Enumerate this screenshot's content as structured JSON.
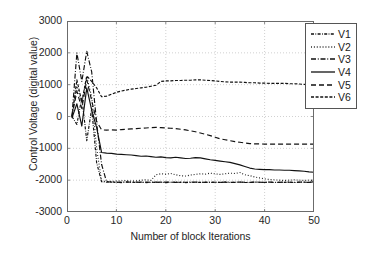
{
  "chart_data": {
    "type": "line",
    "title": "",
    "xlabel": "Number of block Iterations",
    "ylabel": "Control Voltage (digital value)",
    "xlim": [
      0,
      50
    ],
    "ylim": [
      -3000,
      3000
    ],
    "xticks": [
      0,
      10,
      20,
      30,
      40,
      50
    ],
    "yticks": [
      3000,
      2000,
      1000,
      0,
      -1000,
      -2000,
      -3000
    ],
    "grid": true,
    "grid_style": "dotted",
    "legend_position": "top-right",
    "legend_entries": [
      "V1",
      "V2",
      "V3",
      "V4",
      "V5",
      "V6"
    ],
    "x": [
      1,
      2,
      3,
      4,
      5,
      6,
      7,
      8,
      9,
      10,
      11,
      12,
      13,
      14,
      15,
      16,
      17,
      18,
      19,
      20,
      21,
      22,
      23,
      24,
      25,
      26,
      27,
      28,
      29,
      30,
      31,
      32,
      33,
      34,
      35,
      36,
      37,
      38,
      39,
      40,
      41,
      42,
      43,
      44,
      45,
      46,
      47,
      48,
      49,
      50
    ],
    "series": [
      {
        "name": "V1",
        "style": "dashdot-fine",
        "color": "#111111",
        "values": [
          0,
          -250,
          600,
          -760,
          250,
          -1450,
          -2050,
          -2060,
          -2055,
          -2070,
          -2075,
          -2060,
          -2065,
          -2070,
          -2060,
          -2075,
          -2065,
          -2070,
          -2060,
          -2075,
          -2065,
          -2060,
          -2070,
          -2075,
          -2060,
          -2065,
          -2070,
          -2060,
          -2075,
          -2065,
          -2070,
          -2060,
          -2075,
          -2065,
          -2060,
          -2070,
          -2075,
          -2060,
          -2065,
          -2070,
          -2060,
          -2075,
          -2065,
          -2070,
          -2060,
          -2075,
          -2065,
          -2060,
          -2070,
          -2050
        ]
      },
      {
        "name": "V2",
        "style": "dotted",
        "color": "#111111",
        "values": [
          0,
          950,
          430,
          1250,
          620,
          -1000,
          -2030,
          -2040,
          -2035,
          -2030,
          -2020,
          -2010,
          -2030,
          -2020,
          -2000,
          -1990,
          -2010,
          -1830,
          -1800,
          -1810,
          -1790,
          -1830,
          -1860,
          -1870,
          -1840,
          -1820,
          -1800,
          -1810,
          -1780,
          -1800,
          -1820,
          -1800,
          -1780,
          -1790,
          -1760,
          -1830,
          -1860,
          -1900,
          -1930,
          -1960,
          -1980,
          -1990,
          -2000,
          -2010,
          -2000,
          -1990,
          -2000,
          -2010,
          -2000,
          -2010
        ]
      },
      {
        "name": "V3",
        "style": "dashdot",
        "color": "#111111",
        "values": [
          0,
          2000,
          1100,
          2050,
          1400,
          -200,
          -1500,
          -2050,
          -2060,
          -2070,
          -2060,
          -2055,
          -2065,
          -2060,
          -2070,
          -2060,
          -2065,
          -2060,
          -2070,
          -2060,
          -2065,
          -2070,
          -2060,
          -2065,
          -2070,
          -2060,
          -2065,
          -2070,
          -2060,
          -2065,
          -2070,
          -2060,
          -2065,
          -2070,
          -2060,
          -2065,
          -2070,
          -2060,
          -2065,
          -2070,
          -2060,
          -2065,
          -2070,
          -2060,
          -2065,
          -2070,
          -2060,
          -2065,
          -2070,
          -2050
        ]
      },
      {
        "name": "V4",
        "style": "solid",
        "color": "#111111",
        "values": [
          -50,
          400,
          -300,
          900,
          200,
          -350,
          -1130,
          -1150,
          -1160,
          -1180,
          -1190,
          -1200,
          -1210,
          -1230,
          -1250,
          -1240,
          -1260,
          -1280,
          -1270,
          -1290,
          -1300,
          -1280,
          -1300,
          -1320,
          -1310,
          -1290,
          -1300,
          -1330,
          -1360,
          -1380,
          -1400,
          -1420,
          -1440,
          -1480,
          -1520,
          -1570,
          -1620,
          -1650,
          -1660,
          -1670,
          -1670,
          -1680,
          -1680,
          -1690,
          -1690,
          -1700,
          -1710,
          -1720,
          -1740,
          -1750
        ]
      },
      {
        "name": "V5",
        "style": "dashed",
        "color": "#111111",
        "values": [
          0,
          800,
          250,
          1150,
          500,
          -150,
          -420,
          -430,
          -420,
          -430,
          -410,
          -400,
          -390,
          -380,
          -370,
          -360,
          -350,
          -340,
          -350,
          -360,
          -370,
          -380,
          -400,
          -420,
          -450,
          -480,
          -520,
          -560,
          -600,
          -650,
          -700,
          -730,
          -760,
          -790,
          -810,
          -830,
          -850,
          -860,
          -860,
          -870,
          -870,
          -870,
          -870,
          -870,
          -870,
          -870,
          -870,
          -870,
          -870,
          -870
        ]
      },
      {
        "name": "V6",
        "style": "dash-fine",
        "color": "#111111",
        "values": [
          0,
          1150,
          450,
          1280,
          1100,
          900,
          620,
          640,
          700,
          760,
          800,
          830,
          860,
          880,
          900,
          920,
          950,
          980,
          1100,
          1120,
          1120,
          1130,
          1130,
          1140,
          1140,
          1150,
          1150,
          1140,
          1130,
          1120,
          1100,
          1090,
          1080,
          1080,
          1080,
          1070,
          1060,
          1060,
          1050,
          1050,
          1040,
          1040,
          1040,
          1040,
          1030,
          1030,
          1020,
          1010,
          1000,
          1000
        ]
      }
    ]
  }
}
